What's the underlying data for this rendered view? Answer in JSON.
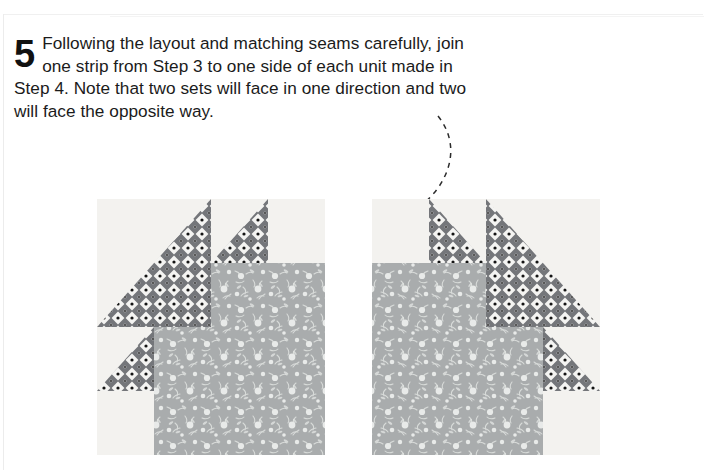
{
  "page": {
    "step_number": "5",
    "instruction_text": "Following the layout and matching seams carefully, join one strip from Step 3 to one side of each unit made in Step 4. Note that two sets will face in one direction and two will face the opposite way.",
    "background_color": "#ffffff",
    "text_color": "#1b1b1b"
  },
  "callout": {
    "type": "curved-dashed-arrow",
    "description": "Dashed curved leader line from end of instruction text to the upper-left corner of the right quilt block",
    "stroke_color": "#2b2b2b",
    "dash_pattern": "5 5",
    "arrowhead": "solid filled triangle pointing down-left"
  },
  "fabrics": {
    "background": {
      "name": "background-muslin",
      "color": "#f3f2ef",
      "description": "plain very light cream solid"
    },
    "print_dark": {
      "name": "dark-geometric-print",
      "color": "#6f7173",
      "accent_color": "#ffffff",
      "dot_color": "#1a1a1a",
      "description": "medium-dark gray geometric print of white diamonds each with a small black center dot"
    },
    "print_floral": {
      "name": "gray-floral-print",
      "color": "#a9acad",
      "accent_color": "#f0f2f0",
      "description": "medium gray tone-on-tone print scattered with small white daisies and leaf sprigs"
    }
  },
  "blocks": [
    {
      "id": "block-left",
      "name": "sunflower-unit-facing-right",
      "orientation": "strip on left side, points face up-right",
      "grid": "4 x 4 half-square-triangle units",
      "x": 97,
      "y": 199,
      "width": 228,
      "height": 256
    },
    {
      "id": "block-right",
      "name": "sunflower-unit-facing-left",
      "orientation": "mirrored - strip on right side, points face up-left",
      "grid": "4 x 4 half-square-triangle units",
      "x": 372,
      "y": 199,
      "width": 228,
      "height": 256
    }
  ]
}
